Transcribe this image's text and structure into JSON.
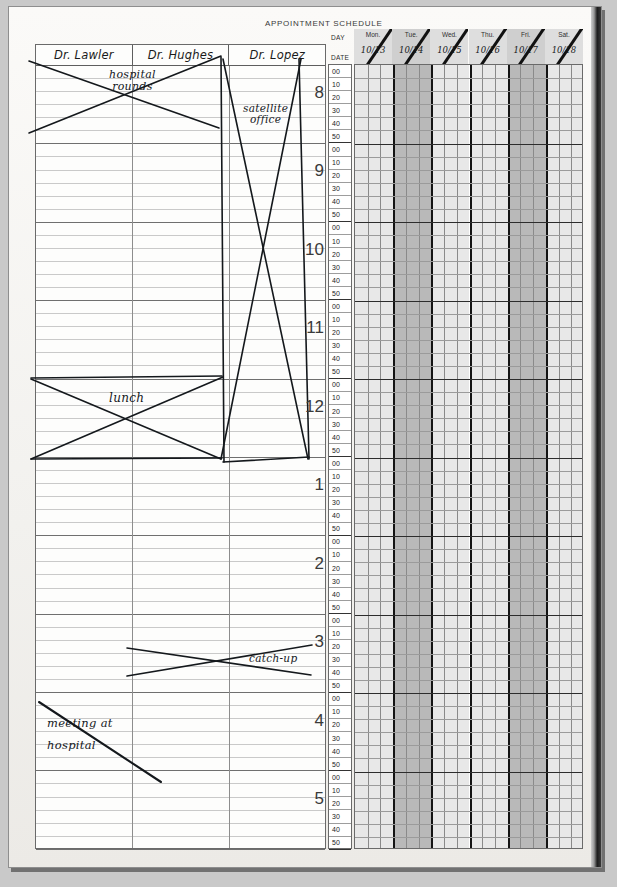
{
  "document": {
    "title": "APPOINTMENT SCHEDULE",
    "day_label": "DAY",
    "date_label": "DATE"
  },
  "providers": [
    {
      "name": "Dr. Lawler"
    },
    {
      "name": "Dr. Hughes"
    },
    {
      "name": "Dr. Lopez"
    }
  ],
  "hours": [
    "8",
    "9",
    "10",
    "11",
    "12",
    "1",
    "2",
    "3",
    "4",
    "5"
  ],
  "minutes": [
    "00",
    "10",
    "20",
    "30",
    "40",
    "50"
  ],
  "days": [
    {
      "name": "Mon.",
      "date": "10/13",
      "shaded": false
    },
    {
      "name": "Tue.",
      "date": "10/14",
      "shaded": true
    },
    {
      "name": "Wed.",
      "date": "10/15",
      "shaded": false
    },
    {
      "name": "Thu.",
      "date": "10/16",
      "shaded": false
    },
    {
      "name": "Fri.",
      "date": "10/17",
      "shaded": true
    },
    {
      "name": "Sat.",
      "date": "10/18",
      "shaded": false
    }
  ],
  "annotations": [
    {
      "id": "hospital-rounds",
      "text": "hospital",
      "line2": "rounds"
    },
    {
      "id": "satellite-office",
      "text": "satellite",
      "line2": "office"
    },
    {
      "id": "lunch",
      "text": "lunch"
    },
    {
      "id": "catch-up",
      "text": "catch-up"
    },
    {
      "id": "meeting-at-hospital",
      "text": "meeting at",
      "line2": "hospital"
    }
  ],
  "colors": {
    "paper": "#f4f3f1",
    "ink": "#14181c",
    "rule": "#c9c9c9",
    "shaded_column": "#b9b9b9",
    "plain_column": "#e8e8e8",
    "binding": "#1d1d1d"
  }
}
